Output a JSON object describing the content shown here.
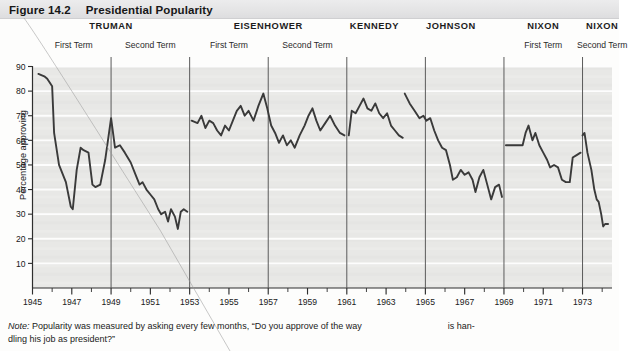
{
  "header": {
    "figure_number": "Figure 14.2",
    "title": "Presidential Popularity"
  },
  "note": {
    "label": "Note:",
    "text_part1": "Popularity was measured by asking every few months, “Do you approve of the way",
    "text_part2": "is han-",
    "text_part3": "dling his job as president?”"
  },
  "chart_data": {
    "type": "line",
    "title": "Presidential Popularity",
    "xlabel": "",
    "ylabel": "Percentage approving",
    "xlim": [
      1945,
      1974.5
    ],
    "ylim": [
      0,
      90
    ],
    "yticks": [
      10,
      20,
      30,
      40,
      50,
      60,
      70,
      80,
      90
    ],
    "xticks": [
      1945,
      1947,
      1949,
      1951,
      1953,
      1955,
      1957,
      1959,
      1961,
      1963,
      1965,
      1967,
      1969,
      1971,
      1973
    ],
    "xtick_labels": [
      "1945",
      "1947",
      "1949",
      "1951",
      "1953",
      "1955",
      "1957",
      "1959",
      "1961",
      "1963",
      "1965",
      "1967",
      "1969",
      "1971",
      "1973"
    ],
    "minor_xtick_step": 1,
    "grid": "horizontal-white",
    "legend": "none",
    "plot_background": "#e8e8e6",
    "line_color": "#3a3a3a",
    "divider_color": "#5a5a5a",
    "term_dividers": [
      1949,
      1953,
      1957,
      1961,
      1965,
      1969,
      1973
    ],
    "presidents": [
      {
        "name": "TRUMAN",
        "terms": [
          "First Term",
          "Second Term"
        ],
        "start": 1945.3,
        "end": 1952.9,
        "label_center": 1949.0,
        "term_label_centers": [
          1947.1,
          1951.0
        ],
        "series": [
          [
            1945.3,
            87
          ],
          [
            1945.6,
            86
          ],
          [
            1945.75,
            85
          ],
          [
            1946.0,
            82
          ],
          [
            1946.1,
            63
          ],
          [
            1946.35,
            50
          ],
          [
            1946.7,
            43
          ],
          [
            1946.95,
            33
          ],
          [
            1947.05,
            32
          ],
          [
            1947.25,
            48
          ],
          [
            1947.45,
            57
          ],
          [
            1947.6,
            56
          ],
          [
            1947.85,
            55
          ],
          [
            1948.05,
            42
          ],
          [
            1948.2,
            41
          ],
          [
            1948.45,
            42
          ],
          [
            1948.7,
            52
          ],
          [
            1949.0,
            69
          ],
          [
            1949.2,
            57
          ],
          [
            1949.45,
            58
          ],
          [
            1949.7,
            55
          ],
          [
            1950.0,
            51
          ],
          [
            1950.25,
            46
          ],
          [
            1950.45,
            42
          ],
          [
            1950.6,
            43
          ],
          [
            1950.8,
            40
          ],
          [
            1951.0,
            38
          ],
          [
            1951.2,
            36
          ],
          [
            1951.4,
            32
          ],
          [
            1951.55,
            30
          ],
          [
            1951.75,
            31
          ],
          [
            1951.9,
            27
          ],
          [
            1952.05,
            32
          ],
          [
            1952.25,
            29
          ],
          [
            1952.4,
            24
          ],
          [
            1952.55,
            31
          ],
          [
            1952.7,
            32
          ],
          [
            1952.88,
            31
          ]
        ]
      },
      {
        "name": "EISENHOWER",
        "terms": [
          "First Term",
          "Second Term"
        ],
        "start": 1953.1,
        "end": 1960.9,
        "label_center": 1957.0,
        "term_label_centers": [
          1955.0,
          1959.0
        ],
        "series": [
          [
            1953.1,
            68
          ],
          [
            1953.4,
            67
          ],
          [
            1953.6,
            70
          ],
          [
            1953.8,
            65
          ],
          [
            1954.0,
            68
          ],
          [
            1954.2,
            67
          ],
          [
            1954.4,
            64
          ],
          [
            1954.6,
            62
          ],
          [
            1954.8,
            66
          ],
          [
            1955.0,
            64
          ],
          [
            1955.2,
            68
          ],
          [
            1955.4,
            72
          ],
          [
            1955.6,
            74
          ],
          [
            1955.8,
            70
          ],
          [
            1956.0,
            72
          ],
          [
            1956.25,
            68
          ],
          [
            1956.5,
            74
          ],
          [
            1956.75,
            79
          ],
          [
            1956.95,
            73
          ],
          [
            1957.15,
            66
          ],
          [
            1957.35,
            63
          ],
          [
            1957.55,
            59
          ],
          [
            1957.75,
            62
          ],
          [
            1957.95,
            58
          ],
          [
            1958.15,
            60
          ],
          [
            1958.35,
            57
          ],
          [
            1958.6,
            62
          ],
          [
            1958.85,
            66
          ],
          [
            1959.05,
            70
          ],
          [
            1959.25,
            73
          ],
          [
            1959.45,
            68
          ],
          [
            1959.65,
            64
          ],
          [
            1959.9,
            67
          ],
          [
            1960.15,
            70
          ],
          [
            1960.4,
            66
          ],
          [
            1960.65,
            63
          ],
          [
            1960.88,
            62
          ]
        ]
      },
      {
        "name": "KENNEDY",
        "terms": [],
        "start": 1961.1,
        "end": 1963.85,
        "label_center": 1962.4,
        "term_label_centers": [],
        "series": [
          [
            1961.1,
            62
          ],
          [
            1961.25,
            72
          ],
          [
            1961.45,
            71
          ],
          [
            1961.65,
            74
          ],
          [
            1961.85,
            77
          ],
          [
            1962.05,
            73
          ],
          [
            1962.25,
            72
          ],
          [
            1962.45,
            75
          ],
          [
            1962.65,
            71
          ],
          [
            1962.85,
            69
          ],
          [
            1963.05,
            71
          ],
          [
            1963.25,
            66
          ],
          [
            1963.45,
            64
          ],
          [
            1963.65,
            62
          ],
          [
            1963.85,
            61
          ]
        ]
      },
      {
        "name": "JOHNSON",
        "terms": [],
        "start": 1963.95,
        "end": 1968.9,
        "label_center": 1966.3,
        "term_label_centers": [],
        "series": [
          [
            1963.95,
            79
          ],
          [
            1964.2,
            75
          ],
          [
            1964.45,
            72
          ],
          [
            1964.7,
            69
          ],
          [
            1964.9,
            70
          ],
          [
            1965.05,
            68
          ],
          [
            1965.25,
            69
          ],
          [
            1965.45,
            64
          ],
          [
            1965.65,
            60
          ],
          [
            1965.85,
            57
          ],
          [
            1966.05,
            56
          ],
          [
            1966.25,
            50
          ],
          [
            1966.4,
            44
          ],
          [
            1966.6,
            45
          ],
          [
            1966.8,
            48
          ],
          [
            1967.0,
            46
          ],
          [
            1967.2,
            47
          ],
          [
            1967.4,
            44
          ],
          [
            1967.55,
            39
          ],
          [
            1967.75,
            45
          ],
          [
            1967.95,
            48
          ],
          [
            1968.15,
            42
          ],
          [
            1968.35,
            36
          ],
          [
            1968.55,
            41
          ],
          [
            1968.75,
            42
          ],
          [
            1968.9,
            37
          ]
        ]
      },
      {
        "name": "NIXON",
        "terms": [
          "First Term"
        ],
        "start": 1969.1,
        "end": 1972.9,
        "label_center": 1971.0,
        "term_label_centers": [
          1971.0
        ],
        "series": [
          [
            1969.1,
            58
          ],
          [
            1969.45,
            58
          ],
          [
            1969.7,
            58
          ],
          [
            1969.95,
            58
          ],
          [
            1970.1,
            63
          ],
          [
            1970.25,
            66
          ],
          [
            1970.45,
            60
          ],
          [
            1970.6,
            63
          ],
          [
            1970.8,
            58
          ],
          [
            1971.0,
            55
          ],
          [
            1971.2,
            52
          ],
          [
            1971.35,
            49
          ],
          [
            1971.55,
            50
          ],
          [
            1971.75,
            49
          ],
          [
            1971.95,
            44
          ],
          [
            1972.15,
            43
          ],
          [
            1972.35,
            43
          ],
          [
            1972.5,
            53
          ],
          [
            1972.7,
            54
          ],
          [
            1972.9,
            55
          ]
        ]
      },
      {
        "name": "NIXON",
        "terms": [
          "Second Term"
        ],
        "start": 1973.0,
        "end": 1974.3,
        "label_center": 1974.0,
        "term_label_centers": [
          1974.0
        ],
        "series": [
          [
            1973.0,
            62
          ],
          [
            1973.1,
            63
          ],
          [
            1973.25,
            55
          ],
          [
            1973.45,
            48
          ],
          [
            1973.6,
            40
          ],
          [
            1973.72,
            36
          ],
          [
            1973.82,
            35
          ],
          [
            1973.95,
            30
          ],
          [
            1974.05,
            25
          ],
          [
            1974.15,
            26
          ],
          [
            1974.3,
            26
          ]
        ]
      }
    ]
  }
}
